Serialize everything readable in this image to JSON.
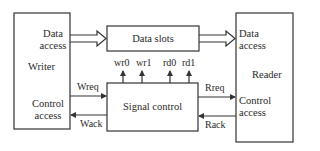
{
  "writer": {
    "title": "Writer",
    "data_access": [
      "Data",
      "access"
    ],
    "control_access": [
      "Control",
      "access"
    ]
  },
  "reader": {
    "title": "Reader",
    "data_access": [
      "Data",
      "access"
    ],
    "control_access": [
      "Control",
      "access"
    ]
  },
  "data_slots": {
    "label": "Data slots"
  },
  "signal_control": {
    "label": "Signal control"
  },
  "signals": {
    "wr0": "wr0",
    "wr1": "wr1",
    "rd0": "rd0",
    "rd1": "rd1",
    "wreq": "Wreq",
    "wack": "Wack",
    "rreq": "Rreq",
    "rack": "Rack"
  },
  "colors": {
    "stroke": "#333333",
    "background": "#ffffff"
  }
}
